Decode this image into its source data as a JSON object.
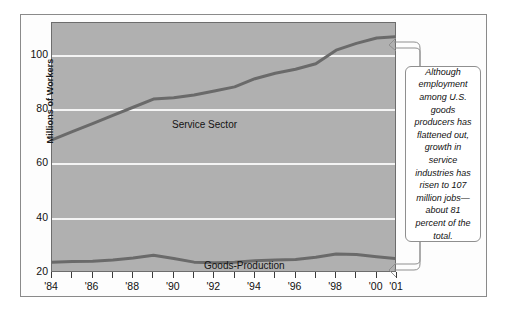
{
  "chart_data": {
    "type": "line",
    "title": "",
    "subtitle": "",
    "xlabel": "",
    "ylabel": "Millions of Workers",
    "ylim": [
      20,
      112
    ],
    "xlim": [
      1984,
      2001
    ],
    "grid": true,
    "gridlines_y": [
      40,
      60,
      80,
      100
    ],
    "legend": "inline-labels",
    "y_tick_labels": [
      "100",
      "80",
      "60",
      "40",
      "20"
    ],
    "y_ticks": [
      100,
      80,
      60,
      40,
      20
    ],
    "x_tick_labels": [
      "'84",
      "'86",
      "'88",
      "'90",
      "'92",
      "'94",
      "'96",
      "'98",
      "'00",
      "'01"
    ],
    "x_tick_values": [
      1984,
      1986,
      1988,
      1990,
      1992,
      1994,
      1996,
      1998,
      2000,
      2001
    ],
    "x_minor_ticks": [
      1984,
      1985,
      1986,
      1987,
      1988,
      1989,
      1990,
      1991,
      1992,
      1993,
      1994,
      1995,
      1996,
      1997,
      1998,
      1999,
      2000,
      2001
    ],
    "x": [
      1984,
      1985,
      1986,
      1987,
      1988,
      1989,
      1990,
      1991,
      1992,
      1993,
      1994,
      1995,
      1996,
      1997,
      1998,
      1999,
      2000,
      2001
    ],
    "series": [
      {
        "name": "Service Sector",
        "color": "#6a6a6a",
        "values": [
          69,
          72,
          75,
          78,
          81,
          84,
          84.5,
          85.5,
          87,
          88.5,
          91.5,
          93.5,
          95,
          97,
          102,
          104.5,
          106.5,
          107
        ]
      },
      {
        "name": "Goods-Production Sector",
        "color": "#6a6a6a",
        "values": [
          24,
          24.2,
          24.3,
          24.8,
          25.5,
          26.5,
          25.3,
          24,
          23.8,
          24,
          24.5,
          24.8,
          25,
          25.8,
          27,
          26.8,
          26,
          25.3
        ]
      }
    ],
    "series_labels": [
      {
        "key": "service",
        "text": "Service Sector"
      },
      {
        "key": "goods",
        "text": "Goods-Production\nSector"
      }
    ],
    "annotations": [
      {
        "key": "callout",
        "text": "Although employment among U.S. goods producers has flattened out, growth in service industries has risen to 107 million jobs—about 81 percent of the total.",
        "points_to": [
          "service-sector-line-end",
          "goods-production-line-end"
        ]
      }
    ]
  },
  "colors": {
    "plot_background": "#b0b0b0",
    "gridline": "#f4f4f4",
    "line": "#6a6a6a",
    "frame_border": "#8a8a8a",
    "panel_border": "#6d6d6d",
    "text": "#111111",
    "callout_background": "#ffffff",
    "callout_border": "#8f8f8f"
  }
}
